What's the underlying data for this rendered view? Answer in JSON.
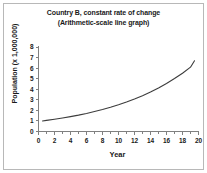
{
  "chart_data": {
    "type": "line",
    "title": "Country B, constant rate of change",
    "subtitle": "(Arithmetic-scale line graph)",
    "xlabel": "Year",
    "ylabel": "Population (x 1,000,000)",
    "xlim": [
      0,
      20
    ],
    "ylim": [
      0,
      8
    ],
    "xticks": [
      0,
      2,
      4,
      6,
      8,
      10,
      12,
      14,
      16,
      18,
      20
    ],
    "xtick_labels": [
      "0",
      "2",
      "4",
      "6",
      "8",
      "10",
      "12",
      "14",
      "16",
      "18",
      "20"
    ],
    "x_minor_tick_step": 1,
    "yticks": [
      0,
      1,
      2,
      3,
      4,
      5,
      6,
      7,
      8
    ],
    "ytick_labels": [
      "0",
      "1",
      "2",
      "3",
      "4",
      "5",
      "6",
      "7",
      "8"
    ],
    "grid": false,
    "legend": false,
    "line_color": "#3c3c3c",
    "axis_color": "#808080",
    "background_color": "#ffffff",
    "border_color": "#b8b8b8",
    "series": [
      {
        "name": "Country B population",
        "x": [
          0.5,
          1,
          2,
          3,
          4,
          5,
          6,
          7,
          8,
          9,
          10,
          11,
          12,
          13,
          14,
          15,
          16,
          17,
          18,
          19,
          19.5
        ],
        "values": [
          1.0,
          1.05,
          1.16,
          1.28,
          1.41,
          1.55,
          1.71,
          1.89,
          2.08,
          2.29,
          2.53,
          2.79,
          3.07,
          3.39,
          3.74,
          4.12,
          4.54,
          5.01,
          5.52,
          6.09,
          6.7
        ]
      }
    ]
  }
}
